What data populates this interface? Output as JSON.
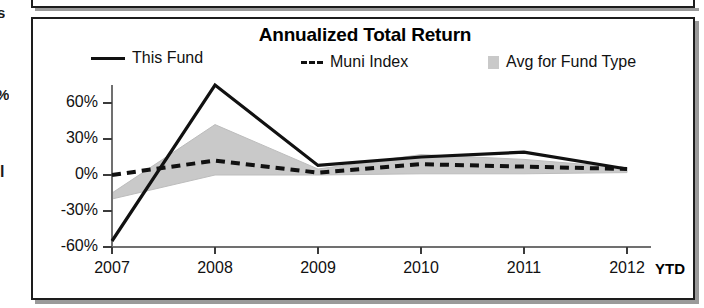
{
  "chart_data": {
    "type": "line",
    "title": "Annualized Total Return",
    "xlabel": "",
    "ylabel": "",
    "categories": [
      "2007",
      "2008",
      "2009",
      "2010",
      "2011",
      "2012"
    ],
    "x_axis_suffix_label": "YTD",
    "ylim": [
      -60,
      78
    ],
    "yticks": [
      60,
      30,
      0,
      -30,
      -60
    ],
    "ytick_labels": [
      "60%",
      "30%",
      "0%",
      "-30%",
      "-60%"
    ],
    "grid": false,
    "legend_position": "top",
    "series": [
      {
        "name": "This Fund",
        "style": "solid",
        "color": "#111111",
        "values": [
          -55,
          75,
          8,
          15,
          19,
          5
        ]
      },
      {
        "name": "Muni Index",
        "style": "dashed",
        "color": "#111111",
        "values": [
          0,
          12,
          2,
          9,
          7,
          5
        ]
      },
      {
        "name": "Avg for Fund Type",
        "style": "band",
        "color": "#c9c9c9",
        "upper": [
          -15,
          42,
          5,
          17,
          13,
          6
        ],
        "lower": [
          -20,
          0,
          0,
          1,
          1,
          2
        ]
      }
    ]
  },
  "legend": {
    "this_fund": "This Fund",
    "muni_index": "Muni Index",
    "avg_fund_type": "Avg for Fund Type"
  },
  "edge_fragments": {
    "top": "s",
    "percent": "%",
    "bar": "l"
  },
  "colors": {
    "band": "#c9c9c9",
    "line": "#111111",
    "axis": "#6b6b6b",
    "border": "#1d1d1d"
  }
}
